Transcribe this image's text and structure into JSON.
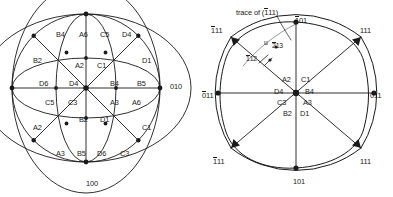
{
  "figure": {
    "caption_title": "",
    "left_diagram": {
      "name": "stereographic-projection-circle",
      "axis_labels": [
        {
          "id": "right-pole",
          "text": "010",
          "overline_index": -1,
          "x": 170,
          "y": 83
        },
        {
          "id": "bottom-pole",
          "text": "100",
          "overline_index": -1,
          "x": 86,
          "y": 180
        }
      ],
      "region_labels": [
        {
          "id": "r1",
          "text": "B4",
          "x": 56,
          "y": 31
        },
        {
          "id": "r2",
          "text": "A6",
          "x": 79,
          "y": 31
        },
        {
          "id": "r3",
          "text": "C5",
          "x": 100,
          "y": 31
        },
        {
          "id": "r4",
          "text": "D4",
          "x": 122,
          "y": 31
        },
        {
          "id": "r5",
          "text": "B2",
          "x": 33,
          "y": 57
        },
        {
          "id": "r6",
          "text": "A2",
          "x": 75,
          "y": 62
        },
        {
          "id": "r7",
          "text": "C1",
          "x": 97,
          "y": 62
        },
        {
          "id": "r8",
          "text": "D1",
          "x": 142,
          "y": 57
        },
        {
          "id": "r9",
          "text": "D6",
          "x": 39,
          "y": 80
        },
        {
          "id": "r10",
          "text": "D4",
          "x": 69,
          "y": 80
        },
        {
          "id": "r11",
          "text": "B4",
          "x": 110,
          "y": 80
        },
        {
          "id": "r12",
          "text": "B5",
          "x": 137,
          "y": 80
        },
        {
          "id": "r13",
          "text": "C5",
          "x": 45,
          "y": 99
        },
        {
          "id": "r14",
          "text": "C3",
          "x": 68,
          "y": 99
        },
        {
          "id": "r15",
          "text": "A3",
          "x": 110,
          "y": 99
        },
        {
          "id": "r16",
          "text": "A6",
          "x": 132,
          "y": 99
        },
        {
          "id": "r17",
          "text": "B2",
          "x": 79,
          "y": 116
        },
        {
          "id": "r18",
          "text": "D1",
          "x": 100,
          "y": 116
        },
        {
          "id": "r19",
          "text": "A2",
          "x": 33,
          "y": 124
        },
        {
          "id": "r20",
          "text": "C1",
          "x": 142,
          "y": 124
        },
        {
          "id": "r21",
          "text": "A3",
          "x": 56,
          "y": 150
        },
        {
          "id": "r22",
          "text": "B5",
          "x": 77,
          "y": 150
        },
        {
          "id": "r23",
          "text": "D6",
          "x": 97,
          "y": 150
        },
        {
          "id": "r24",
          "text": "C3",
          "x": 120,
          "y": 150
        }
      ]
    },
    "right_diagram": {
      "name": "square-pole-figure",
      "annotation": {
        "id": "trace-annotation",
        "text": "trace of (111)",
        "overline_index": 0,
        "x": 236,
        "y": 9
      },
      "pole_labels": [
        {
          "id": "top",
          "text": "101",
          "overline_index": 0,
          "x": 295,
          "y": 17
        },
        {
          "id": "top-left",
          "text": "111",
          "overline_index": 0,
          "x": 211,
          "y": 27
        },
        {
          "id": "top-right",
          "text": "111",
          "overline_index": -1,
          "x": 360,
          "y": 27
        },
        {
          "id": "left",
          "text": "011",
          "overline_index": 0,
          "x": 202,
          "y": 92
        },
        {
          "id": "right",
          "text": "011",
          "overline_index": -1,
          "x": 370,
          "y": 92
        },
        {
          "id": "bottom-left",
          "text": "111",
          "overline_index": 0,
          "x": 213,
          "y": 158
        },
        {
          "id": "bottom-right",
          "text": "111",
          "overline_index": -1,
          "x": 360,
          "y": 158
        },
        {
          "id": "bottom",
          "text": "101",
          "overline_index": -1,
          "x": 293,
          "y": 178
        }
      ],
      "minor_labels": [
        {
          "id": "u-marker",
          "text": "u",
          "overline_index": -1,
          "x": 265,
          "y": 42
        },
        {
          "id": "pole-213",
          "text": "213",
          "overline_index": 0,
          "x": 273,
          "y": 44
        },
        {
          "id": "pole-112",
          "text": "112",
          "overline_index": 0,
          "x": 246,
          "y": 56
        }
      ],
      "center_labels": [
        {
          "id": "c-a2",
          "text": "A2",
          "x": 282,
          "y": 79
        },
        {
          "id": "c-c1",
          "text": "C1",
          "x": 301,
          "y": 79
        },
        {
          "id": "c-d4",
          "text": "D4",
          "x": 276,
          "y": 92
        },
        {
          "id": "c-b4",
          "text": "B4",
          "x": 305,
          "y": 92
        },
        {
          "id": "c-c3",
          "text": "C3",
          "x": 279,
          "y": 102
        },
        {
          "id": "c-a3",
          "text": "A3",
          "x": 303,
          "y": 102
        },
        {
          "id": "c-b2",
          "text": "B2",
          "x": 285,
          "y": 112
        },
        {
          "id": "c-d1",
          "text": "D1",
          "x": 300,
          "y": 112
        }
      ]
    },
    "colors": {
      "stroke": "#1a1a1a",
      "text": "#1a1a1a",
      "background": "#ffffff"
    }
  }
}
